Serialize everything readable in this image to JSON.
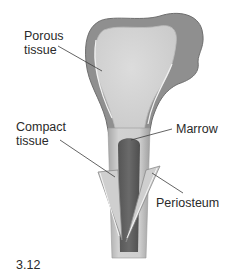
{
  "figure": {
    "number": "3.12",
    "labels": {
      "porous_line1": "Porous",
      "porous_line2": "tissue",
      "compact_line1": "Compact",
      "compact_line2": "tissue",
      "marrow": "Marrow",
      "periosteum": "Periosteum"
    },
    "colors": {
      "outer_shell": "#8a8a8a",
      "porous_fill": "#d6d6d6",
      "marrow_fill": "#5e5e5e",
      "shaft_edge": "#b8b8b8",
      "leader_line": "#444444",
      "background": "#ffffff"
    }
  }
}
